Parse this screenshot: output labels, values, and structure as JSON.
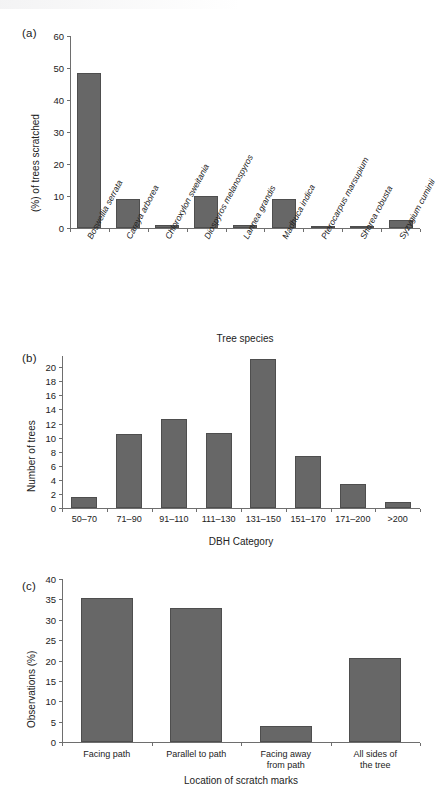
{
  "figure": {
    "panel_a_letter": "(a)",
    "panel_b_letter": "(b)",
    "panel_c_letter": "(c)"
  },
  "chart_data": [
    {
      "type": "bar",
      "panel": "(a)",
      "title": "",
      "xlabel": "Tree species",
      "ylabel": "(%) of trees scratched",
      "categories": [
        "Boswellia serrata",
        "Careya arborea",
        "Chloroxylon sweitania",
        "Diospyros melanospyros",
        "Lannea grandis",
        "Madhuca indica",
        "Pterocarpus marsupium",
        "Shorea robusta",
        "Syzygium cuminii"
      ],
      "values": [
        48.5,
        9.0,
        0.8,
        10.0,
        0.8,
        9.0,
        0.7,
        0.6,
        2.5
      ],
      "ylim": [
        0,
        60
      ],
      "yticks": [
        0,
        10,
        20,
        30,
        40,
        50,
        60
      ],
      "grid": false,
      "legend": "none",
      "categories_italic": true
    },
    {
      "type": "bar",
      "panel": "(b)",
      "title": "",
      "xlabel": "DBH Category",
      "ylabel": "Number of trees",
      "categories": [
        "50–70",
        "71–90",
        "91–110",
        "111–130",
        "131–150",
        "151–170",
        "171–200",
        ">200"
      ],
      "values": [
        1.6,
        10.5,
        12.6,
        10.6,
        21.2,
        7.4,
        3.4,
        0.8
      ],
      "ylim": [
        0,
        21.6
      ],
      "yticks": [
        0,
        2,
        4,
        6,
        8,
        10,
        12,
        14,
        16,
        18,
        20
      ],
      "grid": false,
      "legend": "none"
    },
    {
      "type": "bar",
      "panel": "(c)",
      "title": "",
      "xlabel": "Location of scratch marks",
      "ylabel": "Observations (%)",
      "categories": [
        "Facing path",
        "Parallel to path",
        "Facing away\nfrom path",
        "All sides of\nthe tree"
      ],
      "values": [
        35.3,
        33.0,
        3.9,
        20.5
      ],
      "ylim": [
        0,
        40
      ],
      "yticks": [
        0,
        5,
        10,
        15,
        20,
        25,
        30,
        35,
        40
      ],
      "grid": false,
      "legend": "none"
    }
  ],
  "colors": {
    "bar_fill": "#676767",
    "bar_stroke": "#4e4e4e",
    "axis": "#6e6e6e",
    "text": "#222222",
    "background": "#ffffff"
  }
}
